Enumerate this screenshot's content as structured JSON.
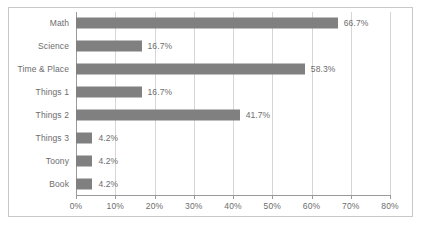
{
  "chart_data": {
    "type": "bar",
    "orientation": "horizontal",
    "title": "",
    "subtitle": "",
    "xlabel": "",
    "ylabel": "",
    "xlim": [
      0,
      80
    ],
    "xtick_step": 10,
    "grid": true,
    "legend": false,
    "categories": [
      "Math",
      "Science",
      "Time & Place",
      "Things 1",
      "Things 2",
      "Things 3",
      "Toony",
      "Book"
    ],
    "values": [
      66.7,
      16.7,
      58.3,
      16.7,
      41.7,
      4.2,
      4.2,
      4.2
    ],
    "data_labels": [
      "66.7%",
      "16.7%",
      "58.3%",
      "16.7%",
      "41.7%",
      "4.2%",
      "4.2%",
      "4.2%"
    ],
    "xtick_labels": [
      "0%",
      "10%",
      "20%",
      "30%",
      "40%",
      "50%",
      "60%",
      "70%",
      "80%"
    ],
    "xtick_values": [
      0,
      10,
      20,
      30,
      40,
      50,
      60,
      70,
      80
    ],
    "colors": {
      "bar": "#808080",
      "gridline": "#d6d6d6",
      "axis": "#9a9a9a",
      "text": "#6d6d6d",
      "border": "#c9c9c9",
      "background": "#ffffff"
    }
  }
}
